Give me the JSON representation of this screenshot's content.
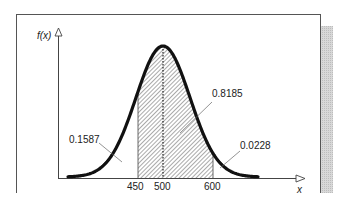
{
  "chart_data": {
    "type": "area",
    "title": "",
    "distribution": "normal",
    "mean": 500,
    "std_dev": 100,
    "xlabel": "x",
    "ylabel": "f(x)",
    "x_ticks": [
      "450",
      "500",
      "600"
    ],
    "shaded_interval": [
      450,
      600
    ],
    "regions": [
      {
        "name": "left tail (x < 450)",
        "area": "0.1587"
      },
      {
        "name": "shaded (450 < x < 600)",
        "area": "0.8185"
      },
      {
        "name": "right tail (x > 600)",
        "area": "0.0228"
      }
    ],
    "annotations": [
      "0.1587",
      "0.8185",
      "0.0228"
    ],
    "grid": false,
    "legend": null
  },
  "labels": {
    "y_axis": "f(x)",
    "x_axis": "x",
    "tick_450": "450",
    "tick_500": "500",
    "tick_600": "600",
    "left_area": "0.1587",
    "center_area": "0.8185",
    "right_area": "0.0228"
  }
}
